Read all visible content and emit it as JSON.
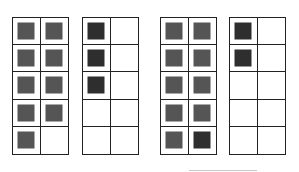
{
  "diagram": {
    "colors": {
      "medium": "#555555",
      "dark": "#2e2e2e",
      "grid": "#222222"
    },
    "frames": [
      {
        "left": 12,
        "cells": [
          "medium",
          "medium",
          "medium",
          "medium",
          "medium",
          "medium",
          "medium",
          "medium",
          "medium",
          "empty"
        ]
      },
      {
        "left": 82,
        "cells": [
          "dark",
          "empty",
          "dark",
          "empty",
          "dark",
          "empty",
          "empty",
          "empty",
          "empty",
          "empty"
        ]
      },
      {
        "left": 160,
        "cells": [
          "medium",
          "medium",
          "medium",
          "medium",
          "medium",
          "medium",
          "medium",
          "medium",
          "medium",
          "dark"
        ]
      },
      {
        "left": 229,
        "cells": [
          "dark",
          "empty",
          "dark",
          "empty",
          "empty",
          "empty",
          "empty",
          "empty",
          "empty",
          "empty"
        ]
      }
    ],
    "answer_line": {
      "visible": true
    }
  }
}
